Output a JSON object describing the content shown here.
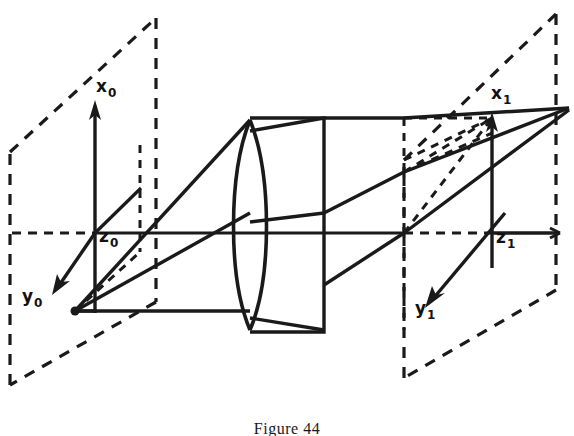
{
  "figure": {
    "caption": "Figure 44",
    "caption_top": 420,
    "background_color": "#ffffff",
    "ink_color": "#1a1a1a",
    "width": 574,
    "height": 436
  },
  "object_plane": {
    "name": "object-plane",
    "style": "dashed-parallelogram",
    "labels": {
      "x_axis": {
        "base": "x",
        "sub": "0",
        "left": 96,
        "top": 78
      },
      "y_axis": {
        "base": "y",
        "sub": "0",
        "left": 22,
        "top": 288
      },
      "z_axis": {
        "base": "z",
        "sub": "0",
        "left": 99,
        "top": 228
      }
    },
    "origin": {
      "x": 95,
      "y": 232
    },
    "object_point": {
      "x": 75,
      "y": 310
    }
  },
  "image_plane": {
    "name": "image-plane",
    "style": "dashed-parallelogram",
    "labels": {
      "x_axis": {
        "base": "x",
        "sub": "1",
        "left": 491,
        "top": 85
      },
      "y_axis": {
        "base": "y",
        "sub": "1",
        "left": 415,
        "top": 300
      },
      "z_axis": {
        "base": "z",
        "sub": "1",
        "left": 496,
        "top": 229
      }
    },
    "origin": {
      "x": 492,
      "y": 233
    },
    "image_point": {
      "x": 570,
      "y": 108
    }
  },
  "lens": {
    "name": "biconvex-lens",
    "housing": {
      "left": 250,
      "top": 118,
      "right": 324,
      "bottom": 332
    },
    "element_left": 248,
    "element_right": 288,
    "element_top": 120,
    "element_bottom": 330
  },
  "optical_axis": {
    "name": "optical-axis",
    "y": 233,
    "from_x": 8,
    "to_x": 566
  },
  "rays": [
    {
      "name": "ray-upper",
      "from": "object-point",
      "to": "image-point"
    },
    {
      "name": "ray-middle",
      "from": "object-point",
      "to": "image-point"
    },
    {
      "name": "ray-lower",
      "from": "object-point",
      "to": "image-point"
    }
  ]
}
